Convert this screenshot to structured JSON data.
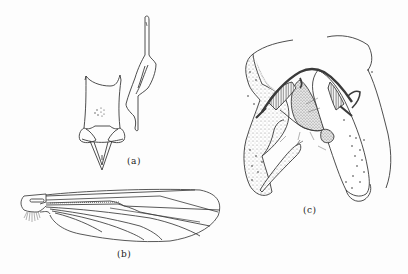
{
  "figure": {
    "panels": [
      {
        "id": "a",
        "label": "(a)",
        "subject": "genitalia-sclerites"
      },
      {
        "id": "b",
        "label": "(b)",
        "subject": "wing"
      },
      {
        "id": "c",
        "label": "(c)",
        "subject": "male-hypopygium"
      }
    ]
  },
  "colors": {
    "ink": "#333333",
    "stipple": "#9a9a9a",
    "background": "#fdfdfd"
  }
}
